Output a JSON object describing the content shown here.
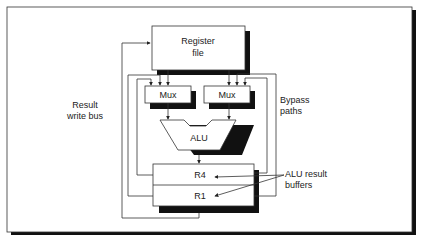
{
  "diagram": {
    "type": "datapath-bypass",
    "blocks": {
      "register_file": {
        "line1": "Register",
        "line2": "file"
      },
      "mux_left": "Mux",
      "mux_right": "Mux",
      "alu": "ALU",
      "buffer_r4": "R4",
      "buffer_r1": "R1"
    },
    "annotations": {
      "result_write_bus": {
        "line1": "Result",
        "line2": "write bus"
      },
      "bypass_paths": {
        "line1": "Bypass",
        "line2": "paths"
      },
      "alu_result_buffers": {
        "line1": "ALU result",
        "line2": "buffers"
      }
    },
    "colors": {
      "stroke": "#222222",
      "shadow": "#111111",
      "fill": "#ffffff"
    }
  }
}
